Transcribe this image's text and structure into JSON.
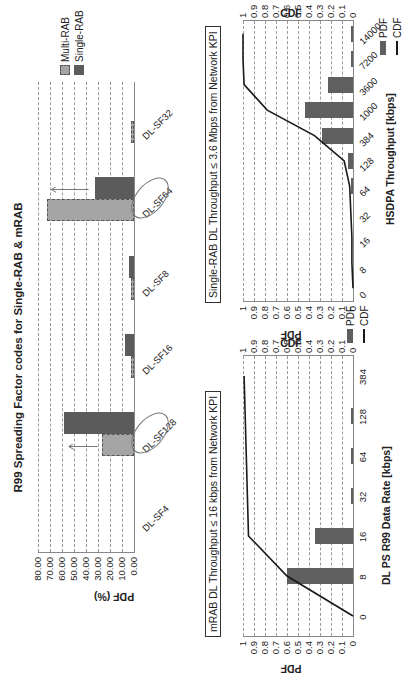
{
  "chart_data": [
    {
      "type": "bar",
      "title": "R99 Spreading Factor codes for Single-RAB & mRAB",
      "xlabel": "",
      "ylabel": "PDF (%)",
      "ylim": [
        0,
        80
      ],
      "yticks": [
        "0.00",
        "10.00",
        "20.00",
        "30.00",
        "40.00",
        "50.00",
        "60.00",
        "70.00",
        "80.00"
      ],
      "categories": [
        "DL-SF4",
        "DL-SF128",
        "DL-SF16",
        "DL-SF8",
        "DL-SF64",
        "DL-SF32"
      ],
      "series": [
        {
          "name": "Multi-RAB",
          "values": [
            0,
            27,
            1,
            1,
            72.5,
            1
          ]
        },
        {
          "name": "Single-RAB",
          "values": [
            0,
            58,
            7.5,
            4,
            32.5,
            0
          ]
        }
      ],
      "legend": [
        "Multi-RAB",
        "Single-RAB"
      ],
      "legend_position": "right",
      "grid": true,
      "annotations": [
        "DL-SF128 circled, arrow shows increase from Multi-RAB to Single-RAB",
        "DL-SF64 circled, arrow shows decrease from Multi-RAB to Single-RAB"
      ]
    },
    {
      "type": "bar",
      "title": "mRAB DL Throughput ≤ 16 kbps from Network KPI",
      "xlabel": "DL PS R99 Data Rate [kbps]",
      "ylabel": "PDF",
      "y2label": "CDF",
      "ylim": [
        0,
        1
      ],
      "yticks": [
        "0",
        "0.1",
        "0.2",
        "0.3",
        "0.4",
        "0.5",
        "0.6",
        "0.7",
        "0.8",
        "0.9",
        "1"
      ],
      "categories": [
        "0",
        "8",
        "16",
        "32",
        "64",
        "128",
        "384"
      ],
      "series": [
        {
          "name": "PDF",
          "type": "bar",
          "values": [
            0,
            0.6,
            0.35,
            0.01,
            0.01,
            0.01,
            0
          ]
        },
        {
          "name": "CDF",
          "type": "line",
          "values": [
            0,
            0.6,
            0.95,
            0.96,
            0.97,
            0.98,
            0.99
          ]
        }
      ],
      "legend": [
        "PDF",
        "CDF"
      ],
      "grid": true
    },
    {
      "type": "bar",
      "title": "Single-RAB DL Throughput ≤ 3.6 Mbps from Network KPI",
      "xlabel": "HSDPA Throughput [kbps]",
      "ylabel": "PDF",
      "y2label": "CDF",
      "ylim": [
        0,
        1
      ],
      "yticks": [
        "0",
        "0.1",
        "0.2",
        "0.3",
        "0.4",
        "0.5",
        "0.6",
        "0.7",
        "0.8",
        "0.9",
        "1"
      ],
      "categories": [
        "0",
        "8",
        "16",
        "32",
        "64",
        "128",
        "384",
        "1000",
        "3600",
        "7200",
        "14000"
      ],
      "series": [
        {
          "name": "PDF",
          "type": "bar",
          "values": [
            0,
            0,
            0,
            0,
            0.01,
            0.05,
            0.28,
            0.44,
            0.23,
            0.01,
            0.01
          ]
        },
        {
          "name": "CDF",
          "type": "line",
          "values": [
            0,
            0.01,
            0.01,
            0.02,
            0.03,
            0.08,
            0.35,
            0.78,
            0.99,
            1,
            1
          ]
        }
      ],
      "legend": [
        "PDF",
        "CDF"
      ],
      "grid": true
    }
  ],
  "top": {
    "title": "R99 Spreading Factor codes for Single-RAB & mRAB",
    "ylabel": "PDF (%)",
    "legend": {
      "multi": "Multi-RAB",
      "single": "Single-RAB"
    }
  },
  "left": {
    "title": "mRAB DL Throughput ≤ 16 kbps from Network KPI",
    "xlabel": "DL PS R99 Data Rate [kbps]",
    "ylabel": "PDF",
    "y2label": "CDF",
    "legend": {
      "pdf": "PDF",
      "cdf": "CDF"
    }
  },
  "right": {
    "title": "Single-RAB DL Throughput ≤ 3.6 Mbps from Network KPI",
    "xlabel": "HSDPA Throughput [kbps]",
    "ylabel": "PDF",
    "y2label": "CDF",
    "legend": {
      "pdf": "PDF",
      "cdf": "CDF"
    }
  },
  "colors": {
    "single": "#5b5b5b",
    "multi": "#a5a5a5",
    "pdf": "#5f5f5f",
    "cdf": "#1a1a1a",
    "grid": "#9a9a9a"
  }
}
